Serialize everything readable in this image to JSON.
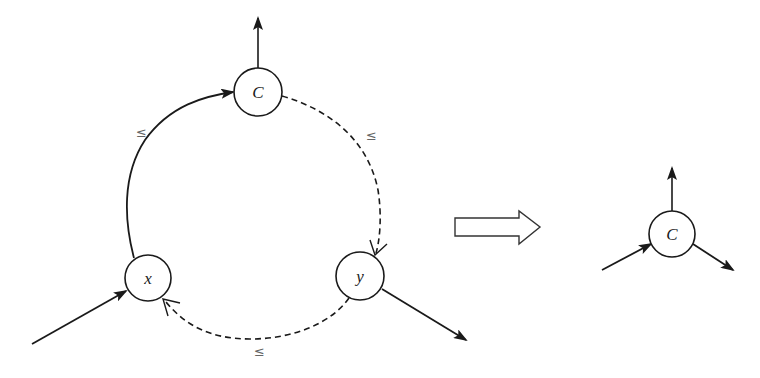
{
  "diagram": {
    "left_graph": {
      "nodes": [
        {
          "id": "C",
          "label": "C"
        },
        {
          "id": "x",
          "label": "x"
        },
        {
          "id": "y",
          "label": "y"
        }
      ],
      "edges": [
        {
          "from": "x",
          "to": "C",
          "style": "solid",
          "label": "≤"
        },
        {
          "from": "C",
          "to": "y",
          "style": "dashed",
          "label": "≤"
        },
        {
          "from": "y",
          "to": "x",
          "style": "dashed",
          "label": "≤"
        }
      ],
      "external_edges": [
        {
          "node": "C",
          "direction": "out",
          "label": ""
        },
        {
          "node": "x",
          "direction": "in",
          "label": ""
        },
        {
          "node": "y",
          "direction": "out",
          "label": ""
        }
      ]
    },
    "transform_arrow": {
      "label": ""
    },
    "right_graph": {
      "nodes": [
        {
          "id": "C",
          "label": "C"
        }
      ],
      "external_edges": [
        {
          "node": "C",
          "direction": "out-up"
        },
        {
          "node": "C",
          "direction": "in"
        },
        {
          "node": "C",
          "direction": "out-down-right"
        }
      ]
    },
    "colors": {
      "stroke": "#1a1a1a",
      "label": "#666666",
      "background": "#ffffff"
    }
  }
}
